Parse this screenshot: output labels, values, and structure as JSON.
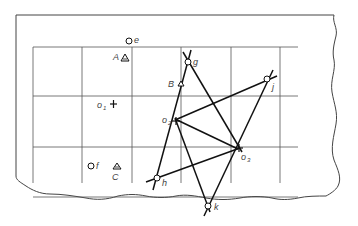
{
  "diagram": {
    "title": "",
    "labels": {
      "e": "e",
      "A": "A",
      "B": "B",
      "C": "C",
      "f": "f",
      "g": "g",
      "j": "j",
      "h": "h",
      "k": "k",
      "o1": "o",
      "o1_sub": "1",
      "o2": "o",
      "o2_sub": "2",
      "o3": "o",
      "o3_sub": "3"
    },
    "colors": {
      "line": "#111111",
      "grid": "#555555",
      "paper": "#ffffff"
    }
  }
}
